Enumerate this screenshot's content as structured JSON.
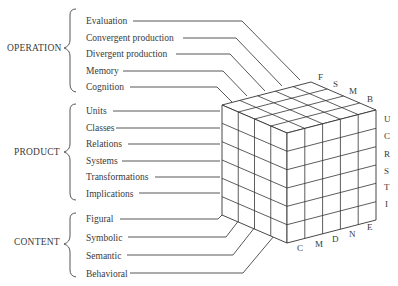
{
  "diagram": {
    "groups": [
      {
        "name": "OPERATION",
        "items": [
          "Evaluation",
          "Convergent production",
          "Divergent production",
          "Memory",
          "Cognition"
        ],
        "axis_codes": [
          "E",
          "N",
          "D",
          "M",
          "C"
        ]
      },
      {
        "name": "PRODUCT",
        "items": [
          "Units",
          "Classes",
          "Relations",
          "Systems",
          "Transformations",
          "Implications"
        ],
        "axis_codes": [
          "U",
          "C",
          "R",
          "S",
          "T",
          "I"
        ]
      },
      {
        "name": "CONTENT",
        "items": [
          "Figural",
          "Symbolic",
          "Semantic",
          "Behavioral"
        ],
        "axis_codes": [
          "F",
          "S",
          "M",
          "B"
        ]
      }
    ],
    "top_edge_labels": [
      "F",
      "S",
      "M",
      "B"
    ],
    "right_edge_labels": [
      "U",
      "C",
      "R",
      "S",
      "T",
      "I"
    ],
    "bottom_edge_labels": [
      "C",
      "M",
      "D",
      "N",
      "E"
    ],
    "cube": {
      "content_divisions": 4,
      "operation_divisions": 5,
      "product_divisions": 6
    },
    "colors": {
      "line": "#333333",
      "text": "#3a3a3a",
      "background": "#ffffff"
    }
  }
}
